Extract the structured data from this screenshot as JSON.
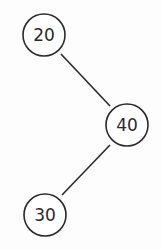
{
  "diagram": {
    "type": "binary-tree",
    "nodes": [
      {
        "id": "n20",
        "label": "20",
        "cx": 44,
        "cy": 35
      },
      {
        "id": "n40",
        "label": "40",
        "cx": 127,
        "cy": 125
      },
      {
        "id": "n30",
        "label": "30",
        "cx": 45,
        "cy": 215
      }
    ],
    "edges": [
      {
        "from": "n20",
        "to": "n40"
      },
      {
        "from": "n40",
        "to": "n30"
      }
    ],
    "colors": {
      "stroke": "#2a2a2a",
      "background": "#fdfdfd"
    }
  }
}
